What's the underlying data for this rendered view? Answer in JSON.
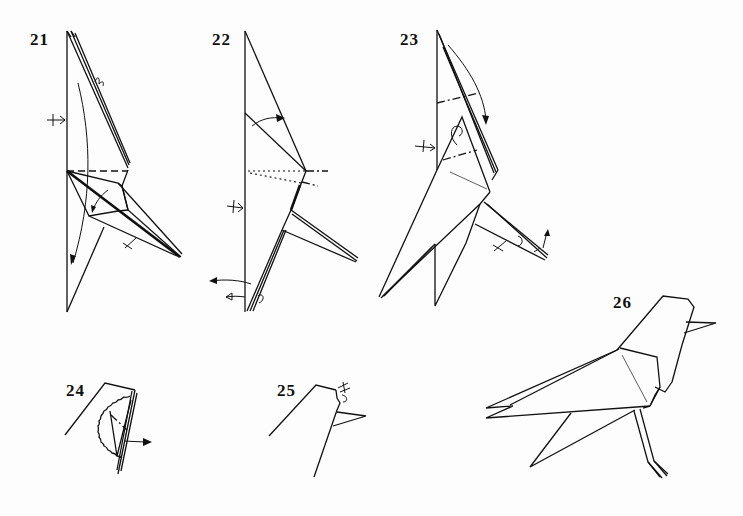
{
  "page": {
    "type": "origami-instruction-diagrams",
    "steps": [
      {
        "number": "21",
        "position": {
          "x": 30,
          "y": 30
        },
        "symbols": [
          "mountain-fold",
          "valley-fold",
          "push-in-arrow",
          "fold-arrow",
          "repeat-arrow"
        ]
      },
      {
        "number": "22",
        "position": {
          "x": 212,
          "y": 30
        },
        "symbols": [
          "valley-fold",
          "x-ray-dotted-line",
          "fold-arrow",
          "turn-over-arrow"
        ]
      },
      {
        "number": "23",
        "position": {
          "x": 400,
          "y": 30
        },
        "symbols": [
          "mountain-fold",
          "fold-arrow",
          "repeat-arrow",
          "push-in-arrow"
        ]
      },
      {
        "number": "24",
        "position": {
          "x": 66,
          "y": 380
        },
        "symbols": [
          "cut-away-view",
          "pull-arrow",
          "hidden-line"
        ]
      },
      {
        "number": "25",
        "position": {
          "x": 277,
          "y": 380
        },
        "symbols": [
          "crimp-fold",
          "beak"
        ]
      },
      {
        "number": "26",
        "position": {
          "x": 613,
          "y": 293
        },
        "symbols": [
          "finished-model"
        ]
      }
    ]
  },
  "colors": {
    "ink": "#111111",
    "paper": "#fdfdfd"
  }
}
